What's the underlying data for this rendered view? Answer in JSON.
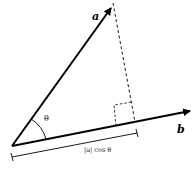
{
  "diagram": {
    "vectors": [
      {
        "name": "a",
        "label": "a",
        "from": [
          12,
          146
        ],
        "to": [
          112,
          6
        ]
      },
      {
        "name": "b",
        "label": "b",
        "from": [
          12,
          146
        ],
        "to": [
          192,
          111
        ]
      }
    ],
    "angle": {
      "label": "θ",
      "between": [
        "a",
        "b"
      ]
    },
    "projection": {
      "label": "|a| cos θ",
      "perpendicular_style": "dashed",
      "right_angle_marker": true
    },
    "colors": {
      "stroke": "#000000",
      "background": "#ffffff"
    }
  }
}
